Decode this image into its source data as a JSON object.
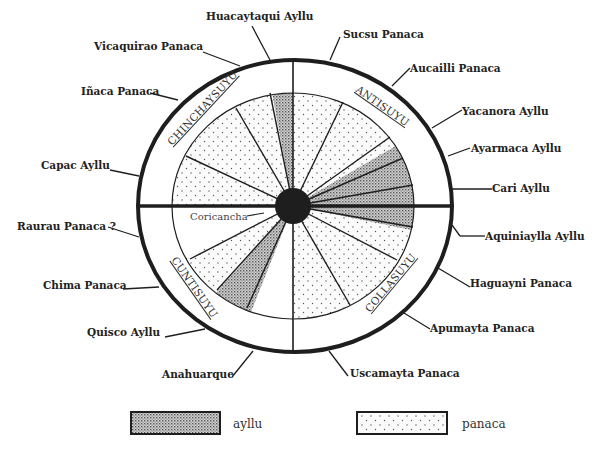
{
  "diagram": {
    "type": "radial ceque-style map of Cusco social divisions",
    "center_label": "Coricancha",
    "suyus": [
      {
        "name": "CHINCHAYSUYU",
        "quadrant": "upper-left"
      },
      {
        "name": "ANTISUYU",
        "quadrant": "upper-right"
      },
      {
        "name": "COLLASUYU",
        "quadrant": "lower-right"
      },
      {
        "name": "CUNTISUYU",
        "quadrant": "lower-left"
      }
    ],
    "labels": [
      {
        "text": "Huacaytaqui Ayllu",
        "kind": "ayllu"
      },
      {
        "text": "Sucsu Panaca",
        "kind": "panaca"
      },
      {
        "text": "Vicaquirao Panaca",
        "kind": "panaca"
      },
      {
        "text": "Aucailli Panaca",
        "kind": "panaca"
      },
      {
        "text": "Iñaca Panaca",
        "kind": "panaca"
      },
      {
        "text": "Yacanora Ayllu",
        "kind": "ayllu"
      },
      {
        "text": "Ayarmaca Ayllu",
        "kind": "ayllu"
      },
      {
        "text": "Capac Ayllu",
        "kind": "ayllu"
      },
      {
        "text": "Cari Ayllu",
        "kind": "ayllu"
      },
      {
        "text": "Raurau Panaca ?",
        "kind": "panaca"
      },
      {
        "text": "Aquiniaylla Ayllu",
        "kind": "ayllu"
      },
      {
        "text": "Chima Panaca",
        "kind": "panaca"
      },
      {
        "text": "Haguayni Panaca",
        "kind": "panaca"
      },
      {
        "text": "Apumayta Panaca",
        "kind": "panaca"
      },
      {
        "text": "Quisco Ayllu",
        "kind": "ayllu"
      },
      {
        "text": "Anahuarque",
        "kind": "other"
      },
      {
        "text": "Uscamayta Panaca",
        "kind": "panaca"
      }
    ]
  },
  "legend": {
    "items": [
      {
        "label": "ayllu",
        "pattern": "dense-dot"
      },
      {
        "label": "panaca",
        "pattern": "sparse-dot"
      }
    ]
  },
  "colors": {
    "ink": "#1e1e1e",
    "ayllu_fill": "#bdbdbd",
    "panaca_fill": "#f6f6f6",
    "background": "#ffffff"
  }
}
